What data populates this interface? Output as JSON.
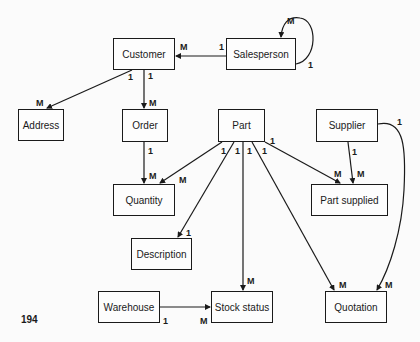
{
  "page_number": "194",
  "entities": {
    "customer": "Customer",
    "salesperson": "Salesperson",
    "address": "Address",
    "order": "Order",
    "part": "Part",
    "supplier": "Supplier",
    "quantity": "Quantity",
    "part_supplied": "Part supplied",
    "description": "Description",
    "warehouse": "Warehouse",
    "stock_status": "Stock status",
    "quotation": "Quotation"
  },
  "relationships": [
    {
      "from": "Salesperson",
      "to": "Customer",
      "from_card": "1",
      "to_card": "M"
    },
    {
      "from": "Salesperson",
      "to": "Salesperson",
      "from_card": "1",
      "to_card": "M"
    },
    {
      "from": "Customer",
      "to": "Address",
      "from_card": "1",
      "to_card": "M"
    },
    {
      "from": "Customer",
      "to": "Order",
      "from_card": "1",
      "to_card": "M"
    },
    {
      "from": "Order",
      "to": "Quantity",
      "from_card": "1",
      "to_card": "M"
    },
    {
      "from": "Part",
      "to": "Quantity",
      "from_card": "1",
      "to_card": "M"
    },
    {
      "from": "Part",
      "to": "Description",
      "from_card": "1",
      "to_card": "1"
    },
    {
      "from": "Part",
      "to": "Stock status",
      "from_card": "1",
      "to_card": "M"
    },
    {
      "from": "Part",
      "to": "Quotation",
      "from_card": "1",
      "to_card": "M"
    },
    {
      "from": "Part",
      "to": "Part supplied",
      "from_card": "1",
      "to_card": "M"
    },
    {
      "from": "Supplier",
      "to": "Part supplied",
      "from_card": "1",
      "to_card": "M"
    },
    {
      "from": "Supplier",
      "to": "Quotation",
      "from_card": "1",
      "to_card": "M"
    },
    {
      "from": "Warehouse",
      "to": "Stock status",
      "from_card": "1",
      "to_card": "M"
    }
  ],
  "labels": {
    "one": "1",
    "many": "M"
  }
}
